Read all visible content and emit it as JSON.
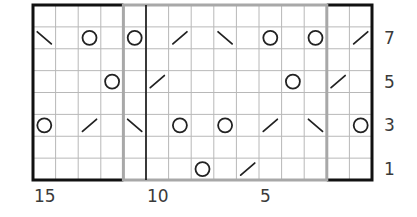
{
  "chart": {
    "columns": 15,
    "rows": 8,
    "grid": {
      "left": 33,
      "top": 5,
      "right": 372,
      "bottom": 180
    },
    "colors": {
      "grid_line": "#b8b8b8",
      "outer_border": "#111111",
      "repeat_border": "#a8a8a8",
      "symbol": "#222222",
      "background": "#ffffff"
    },
    "repeat_box": {
      "from_col_index": 4,
      "to_col_index": 12
    },
    "divider_col_index": 5,
    "row_labels": [
      {
        "row": 7,
        "text": "7"
      },
      {
        "row": 5,
        "text": "5"
      },
      {
        "row": 3,
        "text": "3"
      },
      {
        "row": 1,
        "text": "1"
      }
    ],
    "col_labels": [
      {
        "stitch": 15,
        "text": "15"
      },
      {
        "stitch": 10,
        "text": "10"
      },
      {
        "stitch": 5,
        "text": "5"
      }
    ],
    "legend_symbols": {
      "O": "yarn-over",
      "/": "k2tog",
      "\\": "ssk"
    },
    "symbols": [
      {
        "row": 7,
        "col": 0,
        "type": "\\"
      },
      {
        "row": 7,
        "col": 2,
        "type": "O"
      },
      {
        "row": 7,
        "col": 4,
        "type": "O"
      },
      {
        "row": 7,
        "col": 6,
        "type": "/"
      },
      {
        "row": 7,
        "col": 8,
        "type": "\\"
      },
      {
        "row": 7,
        "col": 10,
        "type": "O"
      },
      {
        "row": 7,
        "col": 12,
        "type": "O"
      },
      {
        "row": 7,
        "col": 14,
        "type": "/"
      },
      {
        "row": 5,
        "col": 3,
        "type": "O"
      },
      {
        "row": 5,
        "col": 5,
        "type": "/"
      },
      {
        "row": 5,
        "col": 11,
        "type": "O"
      },
      {
        "row": 5,
        "col": 13,
        "type": "/"
      },
      {
        "row": 3,
        "col": 0,
        "type": "O"
      },
      {
        "row": 3,
        "col": 2,
        "type": "/"
      },
      {
        "row": 3,
        "col": 4,
        "type": "\\"
      },
      {
        "row": 3,
        "col": 6,
        "type": "O"
      },
      {
        "row": 3,
        "col": 8,
        "type": "O"
      },
      {
        "row": 3,
        "col": 10,
        "type": "/"
      },
      {
        "row": 3,
        "col": 12,
        "type": "\\"
      },
      {
        "row": 3,
        "col": 14,
        "type": "O"
      },
      {
        "row": 1,
        "col": 7,
        "type": "O"
      },
      {
        "row": 1,
        "col": 9,
        "type": "/"
      }
    ]
  }
}
